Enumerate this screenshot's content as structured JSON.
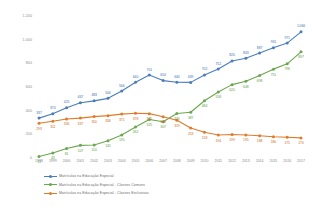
{
  "chart_data": {
    "type": "line",
    "title": "",
    "subtitle": "",
    "xlabel": "",
    "ylabel": "",
    "grid": false,
    "legend_position": "bottom-left",
    "ylim": [
      0,
      1200
    ],
    "yticks": [
      "0",
      "200",
      "400",
      "600",
      "800",
      "1.000",
      "1.200"
    ],
    "ytick_values": [
      0,
      200,
      400,
      600,
      800,
      1000,
      1200
    ],
    "categories": [
      "1998",
      "1999",
      "2000",
      "2001",
      "2002",
      "2003",
      "2004",
      "2005",
      "2006",
      "2007",
      "2008",
      "2009",
      "2010",
      "2011",
      "2012",
      "2013",
      "2014",
      "2015",
      "2016",
      "2017"
    ],
    "series": [
      {
        "name": "Matrículas na Educação Especial",
        "color": "#4a7ebb",
        "values": [
          337,
          374,
          425,
          467,
          483,
          504,
          566,
          640,
          701,
          654,
          640,
          639,
          702,
          752,
          820,
          843,
          887,
          931,
          971,
          1066
        ],
        "labels": [
          "337",
          "374",
          "425",
          "467",
          "483",
          "504",
          "566",
          "640",
          "701",
          "654",
          "640",
          "639",
          "702",
          "752",
          "820",
          "843",
          "887",
          "931",
          "971",
          "1.066"
        ]
      },
      {
        "name": "Matrículas na Educação Especial - Classes Comuns",
        "color": "#6aa84f",
        "values": [
          13,
          43,
          81,
          107,
          110,
          145,
          195,
          262,
          325,
          307,
          376,
          387,
          484,
          558,
          620,
          648,
          698,
          751,
          796,
          897
        ],
        "labels": [
          "13",
          "43",
          "81",
          "107",
          "110",
          "145",
          "195",
          "262",
          "325",
          "307",
          "376",
          "387",
          "484",
          "558",
          "620",
          "648",
          "698",
          "751",
          "796",
          "897"
        ]
      },
      {
        "name": "Matrículas na Educação Especial - Classes Exclusivas",
        "color": "#e07b2a",
        "values": [
          293,
          311,
          330,
          337,
          350,
          358,
          371,
          378,
          375,
          348,
          319,
          253,
          218,
          194,
          199,
          195,
          188,
          180,
          175,
          170
        ],
        "labels": [
          "293",
          "311",
          "330",
          "337",
          "350",
          "358",
          "371",
          "378",
          "375",
          "348",
          "319",
          "253",
          "218",
          "194",
          "199",
          "195",
          "188",
          "180",
          "175",
          "170"
        ]
      }
    ]
  }
}
